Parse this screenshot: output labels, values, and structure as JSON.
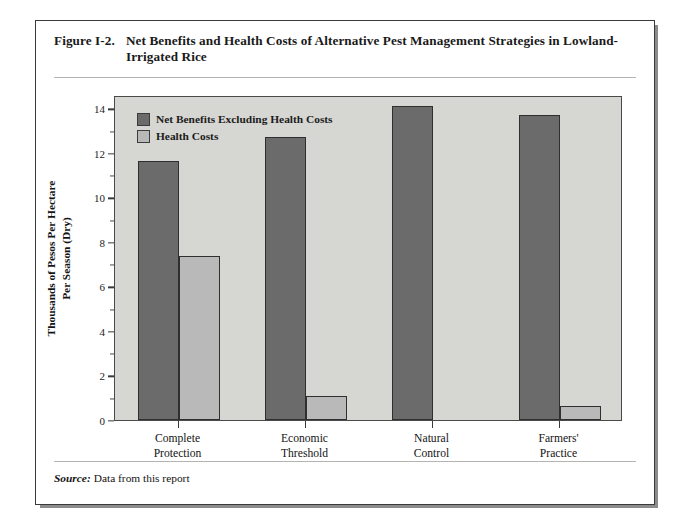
{
  "figure": {
    "number": "Figure I-2.",
    "caption": "Net Benefits and Health Costs of Alternative Pest Management Strategies in Lowland-Irrigated Rice",
    "source_label": "Source:",
    "source_text": "Data from this report"
  },
  "colors": {
    "series_net_benefits": "#6b6b6b",
    "series_health_costs": "#b9b9b9",
    "plot_background": "#d6d6d2",
    "bar_outline": "#2f2f2f",
    "frame": "#4a4a4a",
    "text": "#141414"
  },
  "chart_data": {
    "type": "bar",
    "title": "Net Benefits and Health Costs of Alternative Pest Management Strategies in Lowland-Irrigated Rice",
    "xlabel": "",
    "ylabel": "Thousands of Pesos Per Hectare Per Season (Dry)",
    "ylabel_lines": [
      "Thousands of Pesos Per Hectare",
      "Per Season (Dry)"
    ],
    "categories": [
      "Complete Protection",
      "Economic Threshold",
      "Natural Control",
      "Farmers' Practice"
    ],
    "category_lines": [
      [
        "Complete",
        "Protection"
      ],
      [
        "Economic",
        "Threshold"
      ],
      [
        "Natural",
        "Control"
      ],
      [
        "Farmers'",
        "Practice"
      ]
    ],
    "series": [
      {
        "name": "Net Benefits Excluding Health Costs",
        "color": "#6b6b6b",
        "values": [
          11.65,
          12.7,
          14.1,
          13.7
        ]
      },
      {
        "name": "Health Costs",
        "color": "#b9b9b9",
        "values": [
          7.35,
          1.1,
          0.0,
          0.65
        ]
      }
    ],
    "ylim": [
      0,
      14.6
    ],
    "ytick_major": [
      0,
      2,
      4,
      6,
      8,
      10,
      12,
      14
    ],
    "ytick_minor": [
      1,
      3,
      5,
      7,
      9,
      11,
      13
    ],
    "ytick_labels": [
      "0",
      "2",
      "4",
      "6",
      "8",
      "10",
      "12",
      "14"
    ],
    "grid": false,
    "legend_position": "top-left"
  }
}
